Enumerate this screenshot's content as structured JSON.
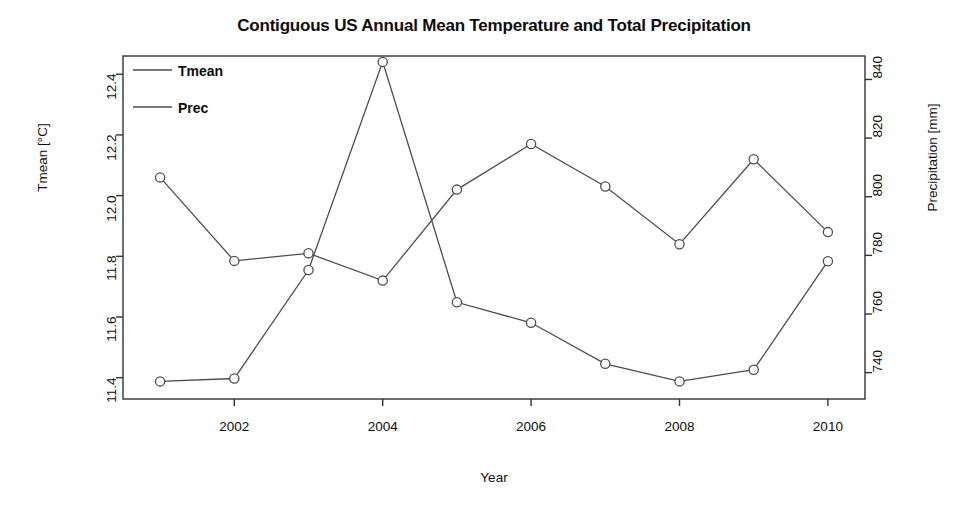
{
  "chart_data": {
    "type": "line",
    "title": "Contiguous US Annual Mean Temperature and Total Precipitation",
    "xlabel": "Year",
    "ylabel": "Tmean [°C]",
    "ylabel_right": "Precipitation [mm]",
    "x": [
      2001,
      2002,
      2003,
      2004,
      2005,
      2006,
      2007,
      2008,
      2009,
      2010
    ],
    "xlim": [
      2000.5,
      2010.5
    ],
    "xticks": [
      2002,
      2004,
      2006,
      2008,
      2010
    ],
    "xtick_labels": [
      "2002",
      "2004",
      "2006",
      "2008",
      "2010"
    ],
    "ylim": [
      11.33,
      12.46
    ],
    "yticks": [
      11.4,
      11.6,
      11.8,
      12.0,
      12.2,
      12.4
    ],
    "ytick_labels": [
      "11.4",
      "11.6",
      "11.8",
      "12.0",
      "12.2",
      "12.4"
    ],
    "ylim_right": [
      731,
      848
    ],
    "yticks_right": [
      740,
      760,
      780,
      800,
      820,
      840
    ],
    "ytick_labels_right": [
      "740",
      "760",
      "780",
      "800",
      "820",
      "840"
    ],
    "grid": false,
    "legend_position": "top-left",
    "marker": "open-circle",
    "line_color": "#4d4d4d",
    "series": [
      {
        "name": "Tmean",
        "axis": "left",
        "values": [
          12.06,
          11.785,
          11.81,
          11.72,
          12.02,
          12.17,
          12.03,
          11.84,
          12.12,
          11.88
        ]
      },
      {
        "name": "Prec",
        "axis": "right",
        "values": [
          737,
          738,
          775,
          846,
          764,
          757,
          743,
          737,
          741,
          778
        ]
      }
    ]
  },
  "legend": {
    "entries": [
      {
        "label": "Tmean"
      },
      {
        "label": "Prec"
      }
    ]
  }
}
